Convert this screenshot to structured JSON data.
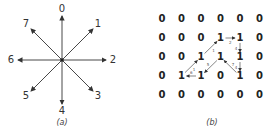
{
  "panel_a": {
    "caption": "(a)",
    "center": [
      62,
      60
    ],
    "directions": [
      {
        "label": "0",
        "dx": 0,
        "dy": -44
      },
      {
        "label": "1",
        "dx": 31,
        "dy": -31
      },
      {
        "label": "2",
        "dx": 44,
        "dy": 0
      },
      {
        "label": "3",
        "dx": 31,
        "dy": 31
      },
      {
        "label": "4",
        "dx": 0,
        "dy": 44
      },
      {
        "label": "5",
        "dx": -31,
        "dy": 31
      },
      {
        "label": "6",
        "dx": -44,
        "dy": 0
      },
      {
        "label": "7",
        "dx": -31,
        "dy": -31
      }
    ]
  },
  "panel_b": {
    "caption": "(b)",
    "grid": [
      [
        "0",
        "0",
        "0",
        "0",
        "0",
        "0"
      ],
      [
        "0",
        "0",
        "0",
        "1",
        "1",
        "0"
      ],
      [
        "0",
        "0",
        "1",
        "1",
        "1",
        "0"
      ],
      [
        "0",
        "1",
        "1",
        "0",
        "1",
        "0"
      ],
      [
        "0",
        "0",
        "0",
        "0",
        "0",
        "0"
      ]
    ],
    "chain": [
      {
        "from": [
          1,
          3
        ],
        "to": [
          1,
          4
        ],
        "code": "2"
      },
      {
        "from": [
          1,
          4
        ],
        "to": [
          2,
          4
        ],
        "code": "4"
      },
      {
        "from": [
          2,
          4
        ],
        "to": [
          3,
          4
        ],
        "code": "4"
      },
      {
        "from": [
          3,
          4
        ],
        "to": [
          2,
          3
        ],
        "code": "7"
      },
      {
        "from": [
          2,
          3
        ],
        "to": [
          3,
          2
        ],
        "code": "5"
      },
      {
        "from": [
          3,
          2
        ],
        "to": [
          3,
          1
        ],
        "code": "6"
      },
      {
        "from": [
          3,
          1
        ],
        "to": [
          2,
          2
        ],
        "code": "1"
      },
      {
        "from": [
          2,
          2
        ],
        "to": [
          1,
          3
        ],
        "code": "1"
      }
    ]
  }
}
